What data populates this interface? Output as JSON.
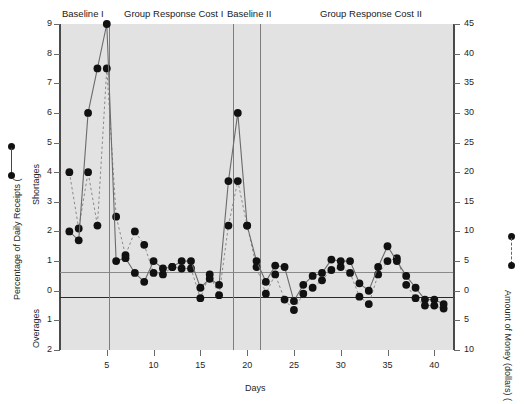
{
  "chart_data": {
    "type": "line",
    "title": "",
    "xlabel": "Days",
    "ylabel_left": "Percentage of Daily Receipts (",
    "ylabel_left_upper": "Shortages",
    "ylabel_left_lower": "Overages",
    "ylabel_right": "Amount of Money (dollars) (",
    "xlim": [
      0,
      42
    ],
    "xticks": [
      5,
      10,
      15,
      20,
      25,
      30,
      35,
      40
    ],
    "xticklabels": [
      "5",
      "10",
      "15",
      "20",
      "25",
      "30",
      "35",
      "40"
    ],
    "ylim_left": [
      -2,
      9
    ],
    "yticks_left": [
      9,
      8,
      7,
      6,
      5,
      4,
      3,
      2,
      1,
      0,
      -1,
      -2
    ],
    "yticklabels_left": [
      "9",
      "8",
      "7",
      "6",
      "5",
      "4",
      "3",
      "2",
      "1",
      "0",
      "1",
      "2"
    ],
    "ylim_right": [
      -10,
      45
    ],
    "yticks_right": [
      45,
      40,
      35,
      30,
      25,
      20,
      15,
      10,
      5,
      0,
      -5,
      -10
    ],
    "yticklabels_right": [
      "45",
      "40",
      "35",
      "30",
      "25",
      "20",
      "15",
      "10",
      "5",
      "0",
      "5",
      "10"
    ],
    "grid": false,
    "reference_lines": [
      {
        "name": "criterion-line",
        "y": 1,
        "style": "solid-gray"
      },
      {
        "name": "zero-line",
        "y": 0,
        "style": "solid-black"
      }
    ],
    "phases": [
      {
        "label": "Baseline I",
        "start": 1,
        "end": 5
      },
      {
        "label": "Group Response Cost I",
        "start": 6,
        "end": 17
      },
      {
        "label": "Baseline II",
        "start": 18,
        "end": 20
      },
      {
        "label": "Group Response Cost II",
        "start": 21,
        "end": 41
      }
    ],
    "phase_dividers": [
      5.5,
      17.5,
      20.5
    ],
    "legend": [
      {
        "name": "percentage-of-daily-receipts",
        "style": "solid",
        "axis": "left"
      },
      {
        "name": "amount-of-money-dollars",
        "style": "dashed",
        "axis": "right"
      }
    ],
    "series": [
      {
        "name": "Percentage of Daily Receipts",
        "axis": "left",
        "style": "solid",
        "marker": "filled-circle",
        "x": [
          1,
          2,
          3,
          4,
          5,
          6,
          7,
          8,
          9,
          10,
          11,
          12,
          13,
          14,
          15,
          16,
          17,
          18,
          19,
          20,
          21,
          22,
          23,
          24,
          25,
          26,
          27,
          28,
          29,
          30,
          31,
          32,
          33,
          34,
          35,
          36,
          37,
          38,
          39,
          40,
          41
        ],
        "values": [
          2.0,
          1.7,
          6.0,
          7.5,
          9.0,
          1.0,
          1.1,
          0.6,
          0.3,
          1.0,
          0.75,
          0.8,
          1.0,
          1.0,
          0.1,
          0.4,
          0.2,
          3.7,
          6.0,
          2.2,
          1.0,
          0.3,
          0.85,
          0.8,
          -0.35,
          0.2,
          0.5,
          0.6,
          1.05,
          1.0,
          1.0,
          0.25,
          0.0,
          0.8,
          1.5,
          1.0,
          0.5,
          0.1,
          -0.3,
          -0.3,
          -0.45
        ]
      },
      {
        "name": "Amount of Money (dollars)",
        "axis": "right",
        "style": "dashed",
        "marker": "filled-circle",
        "x": [
          1,
          2,
          3,
          4,
          5,
          6,
          7,
          8,
          9,
          10,
          11,
          12,
          13,
          14,
          15,
          16,
          17,
          18,
          19,
          20,
          21,
          22,
          23,
          24,
          25,
          26,
          27,
          28,
          29,
          30,
          31,
          32,
          33,
          34,
          35,
          36,
          37,
          38,
          39,
          40,
          41
        ],
        "values_left_scale": [
          4.0,
          2.1,
          4.0,
          2.2,
          7.5,
          2.5,
          1.2,
          2.0,
          1.55,
          0.6,
          0.55,
          0.8,
          0.75,
          0.75,
          -0.25,
          0.55,
          -0.15,
          2.2,
          3.7,
          2.2,
          0.8,
          -0.1,
          0.55,
          -0.3,
          -0.65,
          -0.1,
          0.1,
          0.35,
          0.7,
          0.8,
          0.6,
          -0.2,
          -0.45,
          0.55,
          1.0,
          1.1,
          0.2,
          -0.25,
          -0.5,
          -0.5,
          -0.6
        ]
      }
    ]
  },
  "axes": {
    "left_axis_label": "Percentage of Daily Receipts (",
    "left_upper_region": "Shortages",
    "left_lower_region": "Overages",
    "right_axis_label": "Amount of Money (dollars) (",
    "x_axis_label": "Days"
  }
}
